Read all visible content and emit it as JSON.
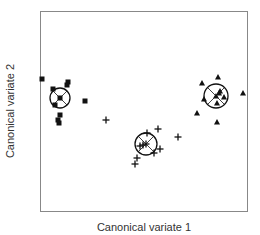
{
  "chart_data": {
    "type": "scatter",
    "title": "",
    "xlabel": "Canonical variate 1",
    "ylabel": "Canonical variate 2",
    "grid": false,
    "axes_ticks": false,
    "legend": null,
    "frame_px": {
      "left": 40,
      "top": 11,
      "right": 247,
      "bottom": 211
    },
    "series": [
      {
        "name": "Group 1",
        "marker": "square",
        "centroid": [
          60,
          98
        ],
        "confidence_circle_radius": 10,
        "points": [
          [
            42,
            79
          ],
          [
            68,
            82
          ],
          [
            67,
            85
          ],
          [
            53,
            89
          ],
          [
            55,
            105
          ],
          [
            85,
            101
          ],
          [
            60,
            115
          ],
          [
            58,
            120
          ],
          [
            59,
            123
          ]
        ]
      },
      {
        "name": "Group 2",
        "marker": "plus",
        "centroid": [
          146,
          144
        ],
        "confidence_circle_radius": 11,
        "points": [
          [
            106,
            120
          ],
          [
            147,
            133
          ],
          [
            158,
            129
          ],
          [
            178,
            137
          ],
          [
            140,
            146
          ],
          [
            143,
            145
          ],
          [
            160,
            149
          ],
          [
            154,
            153
          ],
          [
            137,
            158
          ],
          [
            135,
            164
          ]
        ]
      },
      {
        "name": "Group 3",
        "marker": "triangle",
        "centroid": [
          216,
          96
        ],
        "confidence_circle_radius": 12,
        "points": [
          [
            202,
            83
          ],
          [
            218,
            77
          ],
          [
            243,
            93
          ],
          [
            220,
            91
          ],
          [
            219,
            93
          ],
          [
            224,
            97
          ],
          [
            204,
            99
          ],
          [
            217,
            103
          ],
          [
            197,
            113
          ],
          [
            217,
            122
          ]
        ]
      }
    ],
    "coordinate_note": "point coordinates are pixel positions within the 260x235 figure (no numeric axis ticks shown)"
  },
  "labels": {
    "x": "Canonical variate 1",
    "y": "Canonical variate 2"
  },
  "colors": {
    "frame": "#888888",
    "marker": "#111111",
    "text": "#333333"
  }
}
